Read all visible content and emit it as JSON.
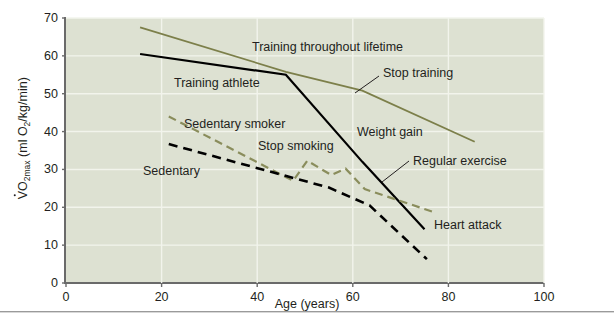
{
  "figure": {
    "background": "#ffffff",
    "plot_background": "#dde1d2",
    "grid_color": "#f2f4ec",
    "axis_color": "#6a6a6a"
  },
  "axes": {
    "y_title_prefix": "V",
    "y_title_rest": "O",
    "y_title_sub": "2max",
    "y_title_units_a": " (ml O",
    "y_title_units_sub": "2",
    "y_title_units_b": "/kg/min)",
    "y_title_full": "VO2max (ml O2/kg/min)",
    "x_title": "Age (years)",
    "y_ticks": [
      "0",
      "10",
      "20",
      "30",
      "40",
      "50",
      "60",
      "70"
    ],
    "x_ticks": [
      "0",
      "20",
      "40",
      "60",
      "80",
      "100"
    ]
  },
  "chart_data": {
    "type": "line",
    "title": "",
    "xlabel": "Age (years)",
    "ylabel": "VO2max (ml O2/kg/min)",
    "xlim": [
      0,
      100
    ],
    "ylim": [
      0,
      70
    ],
    "grid": true,
    "legend": "inline-annotations",
    "series": [
      {
        "name": "Training throughout lifetime",
        "color": "#7c7f4a",
        "style": "solid",
        "width": 1.8,
        "points": [
          [
            15.5,
            67.5
          ],
          [
            46,
            55.8
          ],
          [
            62,
            50.8
          ],
          [
            85.5,
            37.3
          ]
        ]
      },
      {
        "name": "Training athlete / Stop training / Weight gain",
        "color": "#000000",
        "style": "solid",
        "width": 2.2,
        "points": [
          [
            15.5,
            60.5
          ],
          [
            46,
            55.0
          ],
          [
            62,
            32.0
          ],
          [
            75,
            14.2
          ]
        ]
      },
      {
        "name": "Sedentary smoker / Stop smoking / Regular exercise",
        "color": "#8a8d5c",
        "style": "dashed",
        "width": 2.2,
        "points": [
          [
            21.5,
            44.0
          ],
          [
            47.5,
            27.0
          ],
          [
            50.5,
            32.3
          ],
          [
            55.5,
            28.5
          ],
          [
            58.5,
            30.2
          ],
          [
            62.5,
            24.8
          ],
          [
            77.5,
            18.5
          ]
        ]
      },
      {
        "name": "Sedentary / Heart attack",
        "color": "#000000",
        "style": "dashed",
        "width": 2.6,
        "points": [
          [
            21.5,
            36.7
          ],
          [
            55,
            25.2
          ],
          [
            63.5,
            20.5
          ],
          [
            75.5,
            6.3
          ]
        ]
      }
    ],
    "annotations": [
      {
        "label": "Training throughout lifetime",
        "x": 252,
        "y": 41,
        "leader": false
      },
      {
        "label": "Training athlete",
        "x": 174,
        "y": 77,
        "leader": false
      },
      {
        "label": "Stop training",
        "x": 383,
        "y": 67,
        "leader": true,
        "leader_path": "M 379 76 L 355 93"
      },
      {
        "label": "Sedentary smoker",
        "x": 184,
        "y": 118,
        "leader": false
      },
      {
        "label": "Stop smoking",
        "x": 258,
        "y": 140,
        "leader": false
      },
      {
        "label": "Sedentary",
        "x": 143,
        "y": 165,
        "leader": false
      },
      {
        "label": "Weight gain",
        "x": 357,
        "y": 126,
        "leader": false
      },
      {
        "label": "Regular exercise",
        "x": 413,
        "y": 155,
        "leader": true,
        "leader_path": "M 409 161 L 382 182"
      },
      {
        "label": "Heart attack",
        "x": 434,
        "y": 219,
        "leader": false
      }
    ]
  }
}
